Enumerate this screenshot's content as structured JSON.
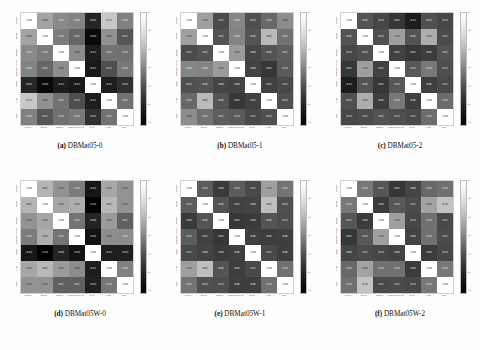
{
  "figure": {
    "background": "#fefefe",
    "colormap": "grayscale-inverted",
    "matrix_size": 7
  },
  "axis_labels": [
    "consensus",
    "appetizer",
    "appetizer2",
    "amoebocyte of cell fraternity",
    "digitize",
    "L-1 lobe",
    "regress"
  ],
  "colorbar": {
    "ticks": [
      "1.0",
      "0.8",
      "0.6",
      "0.4",
      "0.2",
      "0.0",
      "-0.2"
    ],
    "top_color": "#ffffff",
    "bottom_color": "#000000"
  },
  "chart_data": [
    {
      "type": "heatmap",
      "id": "a",
      "title": "DBMat05-0",
      "caption_letter": "(a)",
      "xlabel": "",
      "ylabel": "",
      "categories": [
        "consensus",
        "appetizer",
        "appetizer2",
        "amoebocyte of cell fraternity",
        "digitize",
        "L-1 lobe",
        "regress"
      ],
      "zlim": [
        -0.2,
        1.0
      ],
      "values": [
        [
          1.0,
          0.55,
          0.42,
          0.39,
          -0.07,
          0.73,
          0.38
        ],
        [
          0.55,
          1.0,
          0.36,
          0.25,
          -0.2,
          0.46,
          0.17
        ],
        [
          0.42,
          0.36,
          1.0,
          0.44,
          -0.11,
          0.31,
          0.3
        ],
        [
          0.39,
          0.25,
          0.44,
          1.0,
          -0.13,
          0.13,
          0.34
        ],
        [
          -0.07,
          -0.2,
          -0.11,
          -0.13,
          1.0,
          -0.11,
          -0.02
        ],
        [
          0.73,
          0.46,
          0.31,
          0.13,
          -0.11,
          1.0,
          0.31
        ],
        [
          0.38,
          0.17,
          0.3,
          0.34,
          -0.02,
          0.31,
          1.0
        ]
      ]
    },
    {
      "type": "heatmap",
      "id": "b",
      "title": "DBMat05-1",
      "caption_letter": "(b)",
      "xlabel": "",
      "ylabel": "",
      "categories": [
        "consensus",
        "appetizer",
        "appetizer2",
        "amoebocyte of cell fraternity",
        "digitize",
        "L-1 lobe",
        "regress"
      ],
      "zlim": [
        -0.2,
        1.0
      ],
      "values": [
        [
          1.0,
          0.53,
          0.12,
          0.4,
          0.14,
          0.26,
          0.44
        ],
        [
          0.53,
          1.0,
          0.15,
          0.39,
          0.16,
          0.66,
          0.31
        ],
        [
          0.12,
          0.15,
          1.0,
          0.51,
          0.09,
          0.16,
          0.21
        ],
        [
          0.4,
          0.39,
          0.51,
          1.0,
          0.08,
          0.02,
          0.19
        ],
        [
          0.14,
          0.16,
          0.09,
          0.08,
          1.0,
          0.07,
          0.11
        ],
        [
          0.26,
          0.66,
          0.16,
          0.02,
          0.07,
          1.0,
          0.14
        ],
        [
          0.44,
          0.31,
          0.21,
          0.19,
          0.11,
          0.14,
          1.0
        ]
      ]
    },
    {
      "type": "heatmap",
      "id": "c",
      "title": "DBMat05-2",
      "caption_letter": "(c)",
      "xlabel": "",
      "ylabel": "",
      "categories": [
        "consensus",
        "appetizer",
        "appetizer2",
        "amoebocyte of cell fraternity",
        "digitize",
        "L-1 lobe",
        "regress"
      ],
      "zlim": [
        -0.2,
        1.0
      ],
      "values": [
        [
          1.0,
          0.16,
          0.1,
          0.02,
          -0.11,
          0.14,
          0.1
        ],
        [
          0.16,
          1.0,
          0.14,
          0.53,
          0.16,
          0.6,
          0.12
        ],
        [
          0.1,
          0.14,
          1.0,
          0.07,
          0.02,
          0.05,
          0.15
        ],
        [
          0.02,
          0.53,
          0.07,
          1.0,
          0.18,
          0.34,
          0.13
        ],
        [
          -0.11,
          0.16,
          0.02,
          0.18,
          1.0,
          0.06,
          0.11
        ],
        [
          0.14,
          0.6,
          0.05,
          0.34,
          0.06,
          1.0,
          0.28
        ],
        [
          0.1,
          0.12,
          0.15,
          0.13,
          0.11,
          0.28,
          1.0
        ]
      ]
    },
    {
      "type": "heatmap",
      "id": "d",
      "title": "DBMat05W-0",
      "caption_letter": "(d)",
      "xlabel": "",
      "ylabel": "",
      "categories": [
        "consensus",
        "appetizer",
        "appetizer2",
        "amoebocyte of cell fraternity",
        "digitize",
        "L-1 lobe",
        "regress"
      ],
      "zlim": [
        -0.2,
        1.0
      ],
      "values": [
        [
          1.0,
          0.63,
          0.47,
          0.36,
          -0.14,
          0.57,
          0.47
        ],
        [
          0.63,
          1.0,
          0.57,
          0.6,
          -0.24,
          0.65,
          0.47
        ],
        [
          0.47,
          0.57,
          1.0,
          0.32,
          -0.08,
          0.51,
          0.22
        ],
        [
          0.36,
          0.6,
          0.32,
          1.0,
          -0.16,
          0.44,
          0.43
        ],
        [
          -0.14,
          -0.24,
          -0.08,
          -0.16,
          1.0,
          -0.11,
          -0.1
        ],
        [
          0.57,
          0.65,
          0.51,
          0.44,
          -0.11,
          1.0,
          0.38
        ],
        [
          0.47,
          0.47,
          0.22,
          0.22,
          -0.1,
          0.33,
          1.0
        ]
      ]
    },
    {
      "type": "heatmap",
      "id": "e",
      "title": "DBMat05W-1",
      "caption_letter": "(e)",
      "xlabel": "",
      "ylabel": "",
      "categories": [
        "consensus",
        "appetizer",
        "appetizer2",
        "amoebocyte of cell fraternity",
        "digitize",
        "L-1 lobe",
        "regress"
      ],
      "zlim": [
        -0.2,
        1.0
      ],
      "values": [
        [
          1.0,
          0.2,
          0.04,
          0.2,
          0.11,
          0.53,
          0.32
        ],
        [
          0.2,
          1.0,
          0.16,
          0.07,
          0.08,
          0.68,
          0.14
        ],
        [
          0.04,
          0.16,
          1.0,
          0.02,
          0.04,
          0.16,
          0.13
        ],
        [
          0.2,
          0.07,
          0.02,
          1.0,
          0.06,
          0.05,
          0.06
        ],
        [
          0.11,
          0.08,
          0.04,
          0.06,
          1.0,
          0.11,
          0.06
        ],
        [
          0.53,
          0.68,
          0.16,
          0.05,
          0.11,
          1.0,
          0.3
        ],
        [
          0.32,
          0.14,
          0.13,
          0.06,
          0.06,
          0.3,
          1.0
        ]
      ]
    },
    {
      "type": "heatmap",
      "id": "f",
      "title": "DBMat05W-2",
      "caption_letter": "(f)",
      "xlabel": "",
      "ylabel": "",
      "categories": [
        "consensus",
        "appetizer",
        "appetizer2",
        "amoebocyte of cell fraternity",
        "digitize",
        "L-1 lobe",
        "regress"
      ],
      "zlim": [
        -0.2,
        1.0
      ],
      "values": [
        [
          1.0,
          0.34,
          0.17,
          0.02,
          0.09,
          0.26,
          0.3
        ],
        [
          0.34,
          1.0,
          0.04,
          0.18,
          0.12,
          0.55,
          0.7
        ],
        [
          0.17,
          0.04,
          1.0,
          0.53,
          0.1,
          0.3,
          0.11
        ],
        [
          0.02,
          0.18,
          0.53,
          1.0,
          0.08,
          0.3,
          0.12
        ],
        [
          0.09,
          0.12,
          0.1,
          0.08,
          1.0,
          0.04,
          0.1
        ],
        [
          0.26,
          0.55,
          0.3,
          0.3,
          0.04,
          1.0,
          0.34
        ],
        [
          0.3,
          0.7,
          0.11,
          0.12,
          0.1,
          0.34,
          1.0
        ]
      ]
    }
  ]
}
